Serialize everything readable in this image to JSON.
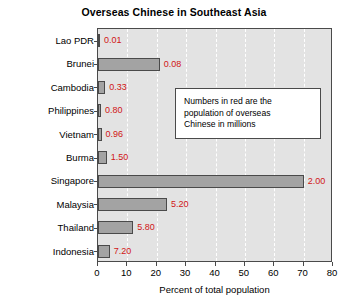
{
  "chart_data": {
    "type": "bar",
    "orientation": "horizontal",
    "title": "Overseas Chinese in Southeast Asia",
    "xlabel": "Percent of total population",
    "ylabel": "",
    "xlim": [
      0,
      80
    ],
    "xticks": [
      0,
      10,
      20,
      30,
      40,
      50,
      60,
      70,
      80
    ],
    "grid": "vertical-dashed-white",
    "legend": "none",
    "categories": [
      "Lao PDR",
      "Brunei",
      "Cambodia",
      "Philippines",
      "Vietnam",
      "Burma",
      "Singapore",
      "Malaysia",
      "Thailand",
      "Indonesia"
    ],
    "values": [
      0.5,
      21.0,
      2.5,
      1.0,
      1.2,
      3.0,
      70.0,
      23.5,
      12.0,
      4.0
    ],
    "value_unit": "percent of total population",
    "data_labels": [
      "0.01",
      "0.08",
      "0.33",
      "0.80",
      "0.96",
      "1.50",
      "2.00",
      "5.20",
      "5.80",
      "7.20"
    ],
    "data_label_unit": "millions of overseas Chinese",
    "annotations": [
      {
        "text": "Numbers in red are the population of overseas Chinese in millions"
      }
    ],
    "colors": {
      "bar_fill": "#a3a3a3",
      "bar_edge": "#4a4a4a",
      "plot_background": "#e3e3e3",
      "gridline": "#ffffff",
      "data_label": "#d11515",
      "text": "#000000",
      "figure_background": "#ffffff"
    }
  },
  "annotation": {
    "line1": "Numbers in red are the",
    "line2": "population of overseas",
    "line3": "Chinese in millions"
  }
}
